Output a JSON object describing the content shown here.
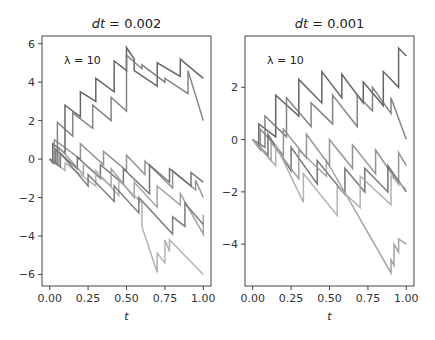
{
  "chart_data": [
    {
      "type": "line",
      "title": "dt = 0.002",
      "title_var": "dt",
      "title_val": " = 0.002",
      "annotation": "λ = 10",
      "xlabel": "t",
      "ylabel": "",
      "xlim": [
        -0.05,
        1.05
      ],
      "ylim": [
        -6.6,
        6.4
      ],
      "xticks": [
        "0.00",
        "0.25",
        "0.50",
        "0.75",
        "1.00"
      ],
      "yticks": [
        "6",
        "4",
        "2",
        "0",
        "−2",
        "−4",
        "−6"
      ],
      "ytick_values": [
        6,
        4,
        2,
        0,
        -2,
        -4,
        -6
      ],
      "description": "Multiple sample paths of a jump process with drift -6 and upward jumps; paths start at 0 at t=0",
      "series": [
        {
          "name": "path1",
          "x": [
            0,
            0.02,
            0.02,
            0.1,
            0.1,
            0.2,
            0.2,
            0.3,
            0.3,
            0.42,
            0.42,
            0.5,
            0.5,
            0.55,
            0.55,
            0.7,
            0.7,
            0.85,
            0.85,
            1.0
          ],
          "y": [
            0,
            -0.2,
            0.8,
            0.3,
            2.8,
            2.2,
            3.5,
            3.0,
            4.2,
            3.5,
            5.1,
            4.6,
            5.8,
            5.2,
            4.6,
            3.8,
            5.0,
            4.3,
            5.2,
            4.2
          ]
        },
        {
          "name": "path2",
          "x": [
            0,
            0.05,
            0.05,
            0.15,
            0.15,
            0.28,
            0.28,
            0.4,
            0.4,
            0.5,
            0.5,
            0.6,
            0.6,
            0.75,
            0.75,
            0.9,
            0.9,
            1.0
          ],
          "y": [
            0,
            -0.3,
            1.9,
            1.2,
            2.4,
            1.6,
            2.8,
            2.0,
            3.2,
            2.5,
            5.4,
            4.7,
            4.9,
            4.0,
            4.2,
            3.4,
            4.6,
            2.0
          ]
        },
        {
          "name": "path3",
          "x": [
            0,
            0.03,
            0.03,
            0.2,
            0.2,
            0.35,
            0.35,
            0.5,
            0.5,
            0.62,
            0.62,
            0.8,
            0.8,
            0.95,
            0.95,
            1.0
          ],
          "y": [
            0,
            -0.2,
            1.0,
            0.0,
            0.8,
            -0.3,
            0.4,
            -0.6,
            0.2,
            -0.8,
            -0.1,
            -1.5,
            -0.6,
            -1.6,
            -1.1,
            -2.0
          ]
        },
        {
          "name": "path4",
          "x": [
            0,
            0.04,
            0.04,
            0.18,
            0.18,
            0.33,
            0.33,
            0.48,
            0.48,
            0.65,
            0.65,
            0.78,
            0.78,
            0.92,
            0.92,
            1.0
          ],
          "y": [
            0,
            -0.2,
            0.5,
            -0.5,
            0.1,
            -1.0,
            -0.3,
            -1.3,
            -0.5,
            -1.8,
            -0.3,
            -1.2,
            -0.5,
            -1.4,
            -0.7,
            -1.2
          ]
        },
        {
          "name": "path5",
          "x": [
            0,
            0.06,
            0.06,
            0.22,
            0.22,
            0.4,
            0.4,
            0.55,
            0.55,
            0.7,
            0.7,
            0.85,
            0.85,
            1.0,
            1.0
          ],
          "y": [
            0,
            -0.3,
            0.6,
            -0.8,
            -0.2,
            -1.4,
            -0.5,
            -2.0,
            -1.2,
            -2.5,
            -1.4,
            -2.4,
            -1.8,
            -3.9,
            -2.9
          ]
        },
        {
          "name": "path6",
          "x": [
            0,
            0.1,
            0.1,
            0.3,
            0.3,
            0.45,
            0.45,
            0.6,
            0.6,
            0.7,
            0.7,
            0.75,
            0.75,
            0.78,
            0.78,
            1.0
          ],
          "y": [
            0,
            -0.6,
            -0.2,
            -1.4,
            -0.6,
            -1.9,
            -1.1,
            -2.3,
            -3.5,
            -5.9,
            -4.9,
            -5.4,
            -4.2,
            -4.8,
            -4.2,
            -6.0
          ]
        },
        {
          "name": "path7",
          "x": [
            0,
            0.07,
            0.07,
            0.25,
            0.25,
            0.42,
            0.42,
            0.58,
            0.58,
            0.8,
            0.8,
            0.88,
            0.88,
            1.0
          ],
          "y": [
            0,
            -0.4,
            0.3,
            -1.4,
            -0.8,
            -2.2,
            -1.4,
            -2.8,
            -2.0,
            -3.9,
            -3.0,
            -3.5,
            -2.3,
            -3.4
          ]
        }
      ]
    },
    {
      "type": "line",
      "title": "dt = 0.001",
      "title_var": "dt",
      "title_val": " = 0.001",
      "annotation": "λ = 10",
      "xlabel": "t",
      "ylabel": "",
      "xlim": [
        -0.05,
        1.05
      ],
      "ylim": [
        -5.6,
        3.96
      ],
      "xticks": [
        "0.00",
        "0.25",
        "0.50",
        "0.75",
        "1.00"
      ],
      "yticks": [
        "2",
        "0",
        "−2",
        "−4"
      ],
      "ytick_values": [
        2,
        0,
        -2,
        -4
      ],
      "description": "Multiple sample paths of a jump process with drift and upward jumps; paths start at 0 at t=0",
      "series": [
        {
          "name": "path1",
          "x": [
            0,
            0.04,
            0.04,
            0.15,
            0.15,
            0.3,
            0.3,
            0.45,
            0.45,
            0.58,
            0.58,
            0.72,
            0.72,
            0.85,
            0.85,
            0.95,
            0.95,
            1.0
          ],
          "y": [
            0,
            -0.3,
            0.6,
            0.1,
            1.7,
            0.9,
            2.3,
            1.4,
            2.6,
            1.6,
            2.5,
            1.4,
            2.2,
            1.3,
            2.6,
            2.0,
            3.5,
            3.2
          ]
        },
        {
          "name": "path2",
          "x": [
            0,
            0.08,
            0.08,
            0.22,
            0.22,
            0.38,
            0.38,
            0.52,
            0.52,
            0.68,
            0.68,
            0.78,
            0.78,
            0.9,
            0.9,
            1.0
          ],
          "y": [
            0,
            -0.3,
            0.9,
            0.1,
            1.6,
            0.5,
            1.4,
            0.6,
            1.7,
            0.5,
            1.7,
            1.1,
            2.0,
            1.0,
            1.6,
            0.0
          ]
        },
        {
          "name": "path3",
          "x": [
            0,
            0.05,
            0.05,
            0.2,
            0.2,
            0.35,
            0.35,
            0.5,
            0.5,
            0.65,
            0.65,
            0.8,
            0.8,
            0.95,
            0.95,
            1.0
          ],
          "y": [
            0,
            -0.4,
            0.4,
            -0.6,
            0.4,
            -0.7,
            0.2,
            -1.0,
            0.0,
            -1.1,
            -0.2,
            -1.3,
            -0.4,
            -1.7,
            -0.5,
            -1.0
          ]
        },
        {
          "name": "path4",
          "x": [
            0,
            0.1,
            0.1,
            0.25,
            0.25,
            0.42,
            0.42,
            0.6,
            0.6,
            0.73,
            0.73,
            0.88,
            0.88,
            1.0
          ],
          "y": [
            0,
            -0.6,
            0.2,
            -1.2,
            -0.3,
            -1.7,
            -0.8,
            -2.1,
            -1.1,
            -2.0,
            -1.1,
            -2.0,
            -1.0,
            -2.0
          ]
        },
        {
          "name": "path5",
          "x": [
            0,
            0.12,
            0.12,
            0.3,
            0.3,
            0.48,
            0.48,
            0.9,
            0.9,
            0.92,
            0.92,
            0.95,
            0.95,
            1.0
          ],
          "y": [
            0,
            -0.8,
            -0.1,
            -1.5,
            -0.4,
            -1.4,
            -0.8,
            -5.1,
            -4.6,
            -4.8,
            -4.0,
            -4.3,
            -3.8,
            -4.0
          ]
        },
        {
          "name": "path6",
          "x": [
            0,
            0.15,
            0.15,
            0.33,
            0.33,
            0.55,
            0.55,
            0.7,
            0.7,
            0.9,
            0.9,
            1.0
          ],
          "y": [
            0,
            -1.0,
            -0.2,
            -2.4,
            -1.3,
            -2.9,
            -1.8,
            -2.6,
            -1.4,
            -2.5,
            -1.4,
            -1.9
          ]
        }
      ]
    }
  ]
}
